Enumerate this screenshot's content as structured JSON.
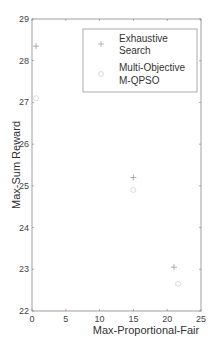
{
  "chart_data": {
    "type": "scatter",
    "title": "",
    "xlabel": "Max-Proportional-Fair",
    "ylabel": "Max-Sum Reward",
    "xlim": [
      0,
      25
    ],
    "ylim": [
      22,
      29
    ],
    "xticks": [
      "0",
      "5",
      "10",
      "15",
      "20",
      "25"
    ],
    "yticks": [
      "22",
      "23",
      "24",
      "25",
      "26",
      "27",
      "28",
      "29"
    ],
    "grid": false,
    "legend_position": "upper right",
    "series": [
      {
        "name": "Exhaustive Search",
        "marker": "plus",
        "points": [
          {
            "x": 0.6,
            "y": 28.35
          },
          {
            "x": 15.0,
            "y": 25.2
          },
          {
            "x": 21.0,
            "y": 23.05
          }
        ]
      },
      {
        "name": "Multi-Objective M-QPSO",
        "marker": "circle",
        "points": [
          {
            "x": 0.6,
            "y": 27.1
          },
          {
            "x": 15.0,
            "y": 24.9
          },
          {
            "x": 21.6,
            "y": 22.65
          }
        ]
      }
    ]
  },
  "legend": {
    "line1a": "Exhaustive",
    "line1b": "Search",
    "line2a": "Multi-Objective",
    "line2b": "M-QPSO"
  }
}
